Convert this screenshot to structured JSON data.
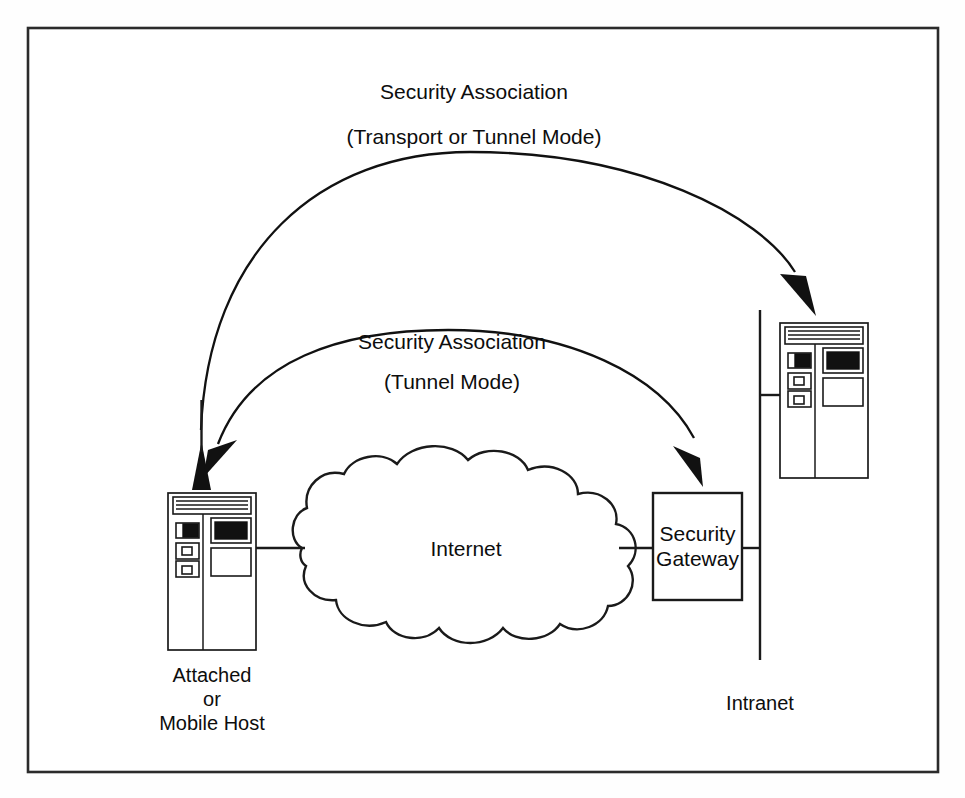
{
  "figure": {
    "type": "network-diagram",
    "title_visible": false,
    "background_color": "#ffffff",
    "line_color": "#111111",
    "frame": {
      "name": "figure-border",
      "x": 28,
      "y": 28,
      "width": 910,
      "height": 744
    }
  },
  "labels": {
    "upper_association_line1": "Security Association",
    "upper_association_line2": "(Transport or Tunnel Mode)",
    "lower_association_line1": "Security Association",
    "lower_association_line2": "(Tunnel Mode)",
    "internet": "Internet",
    "security_gateway_line1": "Security",
    "security_gateway_line2": "Gateway",
    "host_left_line1": "Attached",
    "host_left_line2": "or",
    "host_left_line3": "Mobile Host",
    "intranet": "Intranet"
  },
  "nodes": [
    {
      "id": "host-left",
      "kind": "computer-host-icon",
      "label": "Attached or Mobile Host",
      "x": 168,
      "y": 493,
      "width": 88,
      "height": 157
    },
    {
      "id": "internet-cloud",
      "kind": "cloud",
      "label": "Internet",
      "cx": 452,
      "cy": 548
    },
    {
      "id": "security-gateway",
      "kind": "box",
      "label": "Security Gateway",
      "x": 653,
      "y": 493,
      "width": 89,
      "height": 107
    },
    {
      "id": "host-right",
      "kind": "computer-host-icon",
      "label": "Intranet host",
      "x": 780,
      "y": 323,
      "width": 88,
      "height": 155
    },
    {
      "id": "intranet-backbone",
      "kind": "vertical-line",
      "label": "Intranet",
      "x": 760,
      "y_top": 310,
      "y_bottom": 660
    }
  ],
  "connections": [
    {
      "from": "host-left",
      "to": "internet-cloud",
      "kind": "wire"
    },
    {
      "from": "internet-cloud",
      "to": "security-gateway",
      "kind": "wire"
    },
    {
      "from": "security-gateway",
      "to": "intranet-backbone",
      "kind": "wire"
    },
    {
      "from": "intranet-backbone",
      "to": "host-right",
      "kind": "wire"
    }
  ],
  "associations": [
    {
      "id": "sa-transport-or-tunnel",
      "label_line1": "Security Association",
      "label_line2": "(Transport or Tunnel Mode)",
      "endpoints": [
        "host-left",
        "host-right"
      ],
      "style": "double-headed-arc",
      "mode": "Transport or Tunnel Mode"
    },
    {
      "id": "sa-tunnel",
      "label_line1": "Security Association",
      "label_line2": "(Tunnel Mode)",
      "endpoints": [
        "host-left",
        "security-gateway"
      ],
      "style": "double-headed-arc",
      "mode": "Tunnel Mode"
    }
  ]
}
